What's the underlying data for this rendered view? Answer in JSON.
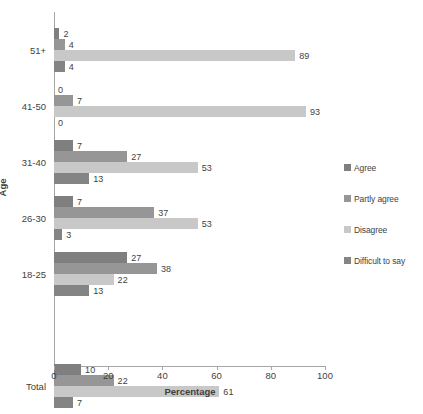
{
  "chart_data": {
    "type": "bar",
    "orientation": "horizontal",
    "title": "",
    "xlabel": "Percentage",
    "ylabel": "Age",
    "xlim": [
      0,
      100
    ],
    "xticks": [
      0,
      20,
      40,
      60,
      80,
      100
    ],
    "grid": false,
    "legend_position": "right",
    "categories": [
      "Total",
      "",
      "18-25",
      "26-30",
      "31-40",
      "41-50",
      "51+"
    ],
    "series": [
      {
        "name": "Agree",
        "color": "#7f7f7f",
        "values": [
          10,
          null,
          27,
          7,
          7,
          0,
          2
        ]
      },
      {
        "name": "Partly agree",
        "color": "#969696",
        "values": [
          22,
          null,
          38,
          37,
          27,
          7,
          4
        ]
      },
      {
        "name": "Disagree",
        "color": "#c8c8c8",
        "values": [
          61,
          null,
          22,
          53,
          53,
          93,
          89
        ]
      },
      {
        "name": "Difficult to say",
        "color": "#848484",
        "values": [
          7,
          null,
          13,
          3,
          13,
          0,
          4
        ]
      }
    ]
  },
  "legend": {
    "items": [
      {
        "label": "Agree",
        "color": "#7f7f7f"
      },
      {
        "label": "Partly agree",
        "color": "#969696"
      },
      {
        "label": "Disagree",
        "color": "#c8c8c8"
      },
      {
        "label": "Difficult to say",
        "color": "#848484"
      }
    ]
  },
  "axes": {
    "x_title": "Percentage",
    "y_title": "Age",
    "x_tick_labels": [
      "0",
      "20",
      "40",
      "60",
      "80",
      "100"
    ],
    "y_tick_labels": [
      "51+",
      "41-50",
      "31-40",
      "26-30",
      "18-25",
      "Total"
    ]
  },
  "groups": [
    {
      "name": "51+",
      "bars": [
        {
          "series": "Agree",
          "value": 2,
          "label": "2",
          "color": "#7f7f7f"
        },
        {
          "series": "Partly agree",
          "value": 4,
          "label": "4",
          "color": "#969696"
        },
        {
          "series": "Disagree",
          "value": 89,
          "label": "89",
          "color": "#c8c8c8"
        },
        {
          "series": "Difficult to say",
          "value": 4,
          "label": "4",
          "color": "#848484"
        }
      ]
    },
    {
      "name": "41-50",
      "bars": [
        {
          "series": "Agree",
          "value": 0,
          "label": "0",
          "color": "#7f7f7f"
        },
        {
          "series": "Partly agree",
          "value": 7,
          "label": "7",
          "color": "#969696"
        },
        {
          "series": "Disagree",
          "value": 93,
          "label": "93",
          "color": "#c8c8c8"
        },
        {
          "series": "Difficult to say",
          "value": 0,
          "label": "0",
          "color": "#848484"
        }
      ]
    },
    {
      "name": "31-40",
      "bars": [
        {
          "series": "Agree",
          "value": 7,
          "label": "7",
          "color": "#7f7f7f"
        },
        {
          "series": "Partly agree",
          "value": 27,
          "label": "27",
          "color": "#969696"
        },
        {
          "series": "Disagree",
          "value": 53,
          "label": "53",
          "color": "#c8c8c8"
        },
        {
          "series": "Difficult to say",
          "value": 13,
          "label": "13",
          "color": "#848484"
        }
      ]
    },
    {
      "name": "26-30",
      "bars": [
        {
          "series": "Agree",
          "value": 7,
          "label": "7",
          "color": "#7f7f7f"
        },
        {
          "series": "Partly agree",
          "value": 37,
          "label": "37",
          "color": "#969696"
        },
        {
          "series": "Disagree",
          "value": 53,
          "label": "53",
          "color": "#c8c8c8"
        },
        {
          "series": "Difficult to say",
          "value": 3,
          "label": "3",
          "color": "#848484"
        }
      ]
    },
    {
      "name": "18-25",
      "bars": [
        {
          "series": "Agree",
          "value": 27,
          "label": "27",
          "color": "#7f7f7f"
        },
        {
          "series": "Partly agree",
          "value": 38,
          "label": "38",
          "color": "#969696"
        },
        {
          "series": "Disagree",
          "value": 22,
          "label": "22",
          "color": "#c8c8c8"
        },
        {
          "series": "Difficult to say",
          "value": 13,
          "label": "13",
          "color": "#848484"
        }
      ]
    },
    {
      "name": "Total",
      "bars": [
        {
          "series": "Agree",
          "value": 10,
          "label": "10",
          "color": "#7f7f7f"
        },
        {
          "series": "Partly agree",
          "value": 22,
          "label": "22",
          "color": "#969696"
        },
        {
          "series": "Disagree",
          "value": 61,
          "label": "61",
          "color": "#c8c8c8"
        },
        {
          "series": "Difficult to say",
          "value": 7,
          "label": "7",
          "color": "#848484"
        }
      ]
    }
  ]
}
